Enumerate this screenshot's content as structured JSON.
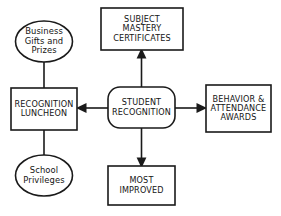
{
  "diagram": {
    "background_color": "#ffffff",
    "stroke_color": "#1a1a1a",
    "text_color": "#141414",
    "center": {
      "id": "student-recognition",
      "shape": "rounded-rectangle",
      "line1": "STUDENT",
      "line2": "RECOGNITION"
    },
    "top": {
      "id": "subject-mastery-certificates",
      "shape": "rectangle",
      "line1": "SUBJECT",
      "line2": "MASTERY",
      "line3": "CERTIFICATES"
    },
    "right": {
      "id": "behavior-attendance-awards",
      "shape": "rectangle",
      "line1": "BEHAVIOR &",
      "line2": "ATTENDANCE",
      "line3": "AWARDS"
    },
    "bottom": {
      "id": "most-improved",
      "shape": "rectangle",
      "line1": "MOST",
      "line2": "IMPROVED"
    },
    "left": {
      "id": "recognition-luncheon",
      "shape": "rectangle",
      "line1": "RECOGNITION",
      "line2": "LUNCHEON"
    },
    "upper_left_ellipse": {
      "id": "business-gifts-and-prizes",
      "shape": "ellipse",
      "line1": "Business",
      "line2": "Gifts and",
      "line3": "Prizes"
    },
    "lower_left_ellipse": {
      "id": "school-privileges",
      "shape": "ellipse",
      "line1": "School",
      "line2": "Privileges"
    },
    "connectors": [
      {
        "from": "student-recognition",
        "to": "subject-mastery-certificates",
        "style": "arrow",
        "direction": "up"
      },
      {
        "from": "student-recognition",
        "to": "behavior-attendance-awards",
        "style": "arrow",
        "direction": "right"
      },
      {
        "from": "student-recognition",
        "to": "most-improved",
        "style": "arrow",
        "direction": "down"
      },
      {
        "from": "student-recognition",
        "to": "recognition-luncheon",
        "style": "arrow",
        "direction": "left"
      },
      {
        "from": "business-gifts-and-prizes",
        "to": "recognition-luncheon",
        "style": "plain-line",
        "direction": "down"
      },
      {
        "from": "recognition-luncheon",
        "to": "school-privileges",
        "style": "plain-line",
        "direction": "down"
      }
    ]
  }
}
